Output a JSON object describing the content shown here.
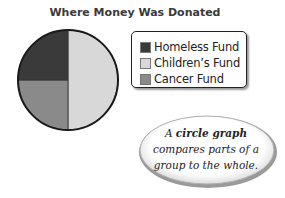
{
  "chart_data": {
    "type": "pie",
    "title": "Where Money Was Donated",
    "categories": [
      "Homeless Fund",
      "Children's Fund",
      "Cancer Fund"
    ],
    "values": [
      25,
      50,
      25
    ],
    "unit": "percent of whole (estimated from slice angles)",
    "colors": [
      "#3a3a3a",
      "#d8d8d8",
      "#8a8a8a"
    ],
    "legend_position": "right",
    "xlabel": "",
    "ylabel": ""
  },
  "title": "Where Money Was Donated",
  "legend": {
    "items": [
      {
        "label": "Homeless Fund",
        "color": "#3a3a3a"
      },
      {
        "label": "Children’s Fund",
        "color": "#d8d8d8"
      },
      {
        "label": "Cancer Fund",
        "color": "#8a8a8a"
      }
    ]
  },
  "callout": {
    "prefix": "A ",
    "term": "circle graph",
    "line2": "compares parts of a",
    "line3": "group to the whole."
  }
}
